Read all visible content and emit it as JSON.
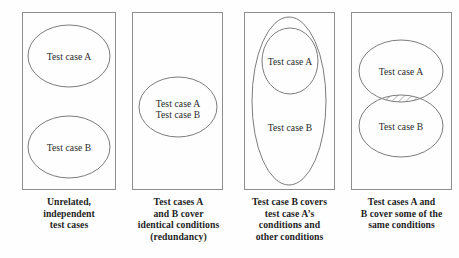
{
  "figure": {
    "line_color": "#7c7c7c",
    "box_color": "#8e8e8e",
    "text_color": "#2a2a2a",
    "background": "#fefefe"
  },
  "panels": [
    {
      "id": "panel-unrelated",
      "shape": "two-separate-ellipses",
      "labels": [
        "Test case A",
        "Test case B"
      ],
      "caption": "Unrelated,\nindependent\ntest cases",
      "caption_lines": [
        "Unrelated,",
        "independent",
        "test cases"
      ]
    },
    {
      "id": "panel-identical",
      "shape": "single-ellipse-two-labels",
      "labels": [
        "Test case A",
        "Test case B"
      ],
      "caption": "Test cases A\nand B cover\nidentical conditions\n(redundancy)",
      "caption_lines": [
        "Test cases A",
        "and B cover",
        "identical conditions",
        "(redundancy)"
      ]
    },
    {
      "id": "panel-subset",
      "shape": "nested-ellipses",
      "labels": [
        "Test case A",
        "Test case B"
      ],
      "caption": "Test case B covers\ntest case A's\nconditions and\nother conditions",
      "caption_lines": [
        "Test case B covers",
        "test case A’s",
        "conditions and",
        "other conditions"
      ]
    },
    {
      "id": "panel-overlap",
      "shape": "overlapping-ellipses-hatched-intersection",
      "labels": [
        "Test case A",
        "Test case B"
      ],
      "caption": "Test cases A and\nB cover some of the\nsame conditions",
      "caption_lines": [
        "Test cases A and",
        "B cover some of the",
        "same conditions"
      ]
    }
  ]
}
